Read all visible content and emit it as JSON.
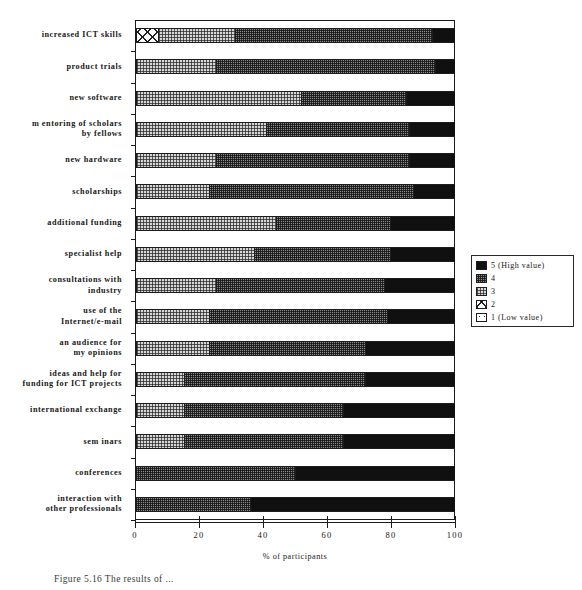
{
  "chart_data": {
    "type": "bar",
    "subtype": "horizontal-stacked-100",
    "title": "",
    "xlabel": "% of participants",
    "ylabel": "",
    "xlim": [
      0,
      100
    ],
    "xticks": [
      0,
      20,
      40,
      60,
      80,
      100
    ],
    "xtick_labels": [
      "0",
      "20",
      "40",
      "60",
      "80",
      "100"
    ],
    "grid": false,
    "legend_position": "right",
    "legend_title": "",
    "categories": [
      "increased ICT skills",
      "product trials",
      "new software",
      "mentoring of scholars by fellows",
      "new hardware",
      "scholarships",
      "additional funding",
      "specialist help",
      "consultations with industry",
      "use of the Internet/e-mail",
      "an audience for my opinions",
      "ideas and help for funding for ICT projects",
      "international exchange",
      "seminars",
      "conferences",
      "interaction with other professionals"
    ],
    "category_lines": [
      [
        "increased ICT skills"
      ],
      [
        "product trials"
      ],
      [
        "new software"
      ],
      [
        "m entoring of scholars",
        "by fellows"
      ],
      [
        "new hardware"
      ],
      [
        "scholarships"
      ],
      [
        "additional funding"
      ],
      [
        "specialist help"
      ],
      [
        "consultations with",
        "industry"
      ],
      [
        "use of the",
        "Internet/e-mail"
      ],
      [
        "an audience for",
        "my opinions"
      ],
      [
        "ideas and help for",
        "funding for ICT projects"
      ],
      [
        "international exchange"
      ],
      [
        "sem inars"
      ],
      [
        "conferences"
      ],
      [
        "interaction with",
        "other professionals"
      ]
    ],
    "series": [
      {
        "name": "1 (Low value)",
        "level": 1,
        "pattern": "white-dotted",
        "color": "#ffffff",
        "values": [
          0,
          0,
          0,
          0,
          0,
          0,
          0,
          0,
          0,
          0,
          0,
          0,
          0,
          0,
          0,
          0
        ]
      },
      {
        "name": "2",
        "level": 2,
        "pattern": "white-crosshatch",
        "color": "#ffffff",
        "values": [
          7,
          0,
          0,
          0,
          0,
          0,
          0,
          0,
          0,
          0,
          0,
          0,
          0,
          0,
          0,
          0
        ]
      },
      {
        "name": "3",
        "level": 3,
        "pattern": "light-gray-dither",
        "color": "#d7d7d7",
        "values": [
          24,
          25,
          52,
          41,
          25,
          23,
          44,
          37,
          25,
          23,
          23,
          15,
          15,
          15,
          0,
          0
        ]
      },
      {
        "name": "4",
        "level": 4,
        "pattern": "dark-gray-dither",
        "color": "#8a8a8a",
        "values": [
          62,
          69,
          33,
          45,
          61,
          64,
          36,
          43,
          53,
          56,
          49,
          57,
          50,
          50,
          50,
          36
        ]
      },
      {
        "name": "5 (High value)",
        "level": 5,
        "pattern": "solid-black",
        "color": "#101010",
        "values": [
          7,
          6,
          15,
          14,
          14,
          13,
          20,
          20,
          22,
          21,
          28,
          28,
          35,
          35,
          50,
          64
        ]
      }
    ],
    "stack_boundaries": [
      [
        0,
        7,
        31,
        93,
        100
      ],
      [
        0,
        0,
        25,
        94,
        100
      ],
      [
        0,
        0,
        52,
        85,
        100
      ],
      [
        0,
        0,
        41,
        86,
        100
      ],
      [
        0,
        0,
        25,
        86,
        100
      ],
      [
        0,
        0,
        23,
        87,
        100
      ],
      [
        0,
        0,
        44,
        80,
        100
      ],
      [
        0,
        0,
        37,
        80,
        100
      ],
      [
        0,
        0,
        25,
        78,
        100
      ],
      [
        0,
        0,
        23,
        79,
        100
      ],
      [
        0,
        0,
        23,
        72,
        100
      ],
      [
        0,
        0,
        15,
        72,
        100
      ],
      [
        0,
        0,
        15,
        65,
        100
      ],
      [
        0,
        0,
        15,
        65,
        100
      ],
      [
        0,
        0,
        0,
        50,
        100
      ],
      [
        0,
        0,
        0,
        36,
        100
      ]
    ]
  },
  "legend": {
    "items": [
      {
        "label": "5 (High value)",
        "level": 5
      },
      {
        "label": "4",
        "level": 4
      },
      {
        "label": "3",
        "level": 3
      },
      {
        "label": "2",
        "level": 2
      },
      {
        "label": "1 (Low value)",
        "level": 1
      }
    ]
  },
  "caption": {
    "text": "Figure 5.16   The results of ..."
  }
}
